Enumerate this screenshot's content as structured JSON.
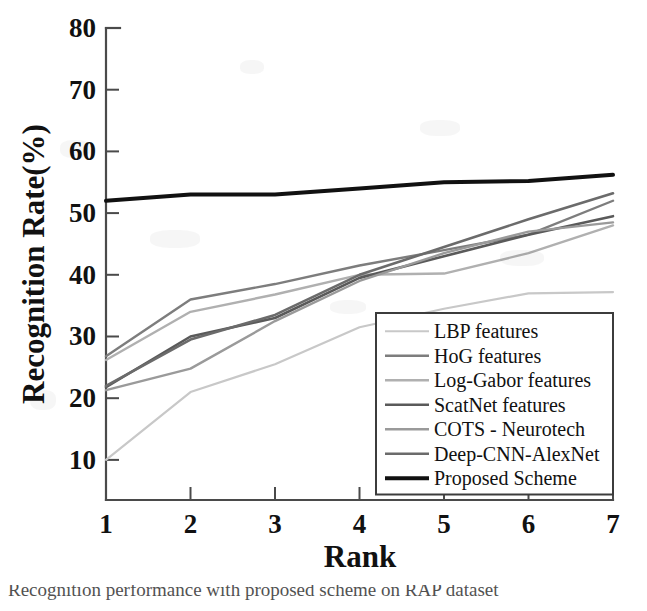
{
  "figure": {
    "caption_partial": "Recognition performance with proposed scheme on RAP dataset"
  },
  "chart_data": {
    "type": "line",
    "title": "",
    "xlabel": "Rank",
    "ylabel": "Recognition Rate(%)",
    "x": [
      1,
      2,
      3,
      4,
      5,
      6,
      7
    ],
    "categories": [
      "1",
      "2",
      "3",
      "4",
      "5",
      "6",
      "7"
    ],
    "xtick_labels": [
      "1",
      "2",
      "3",
      "4",
      "5",
      "6",
      "7"
    ],
    "ytick_labels": [
      "10",
      "20",
      "30",
      "40",
      "50",
      "60",
      "70",
      "80"
    ],
    "yticks": [
      10,
      20,
      30,
      40,
      50,
      60,
      70,
      80
    ],
    "xlim": [
      1,
      7
    ],
    "ylim": [
      3.5,
      80
    ],
    "grid": false,
    "legend_position": "lower right",
    "series": [
      {
        "name": "LBP features",
        "color": "#c8c8c8",
        "width": 2.2,
        "values": [
          10.0,
          21.0,
          25.5,
          31.5,
          34.5,
          37.0,
          37.2
        ]
      },
      {
        "name": "HoG features",
        "color": "#7d7d7d",
        "width": 2.4,
        "values": [
          26.8,
          36.0,
          38.5,
          41.5,
          44.0,
          46.5,
          52.0
        ]
      },
      {
        "name": "Log-Gabor features",
        "color": "#b0b0b0",
        "width": 2.4,
        "values": [
          26.2,
          34.0,
          36.8,
          40.0,
          40.2,
          43.5,
          48.0
        ]
      },
      {
        "name": "ScatNet features",
        "color": "#5a5a5a",
        "width": 2.6,
        "values": [
          21.8,
          30.0,
          33.0,
          39.5,
          43.0,
          46.5,
          49.5
        ]
      },
      {
        "name": "COTS - Neurotech",
        "color": "#9a9a9a",
        "width": 2.4,
        "values": [
          21.3,
          24.8,
          32.5,
          39.0,
          43.5,
          47.0,
          48.5
        ]
      },
      {
        "name": "Deep-CNN-AlexNet",
        "color": "#6b6b6b",
        "width": 2.6,
        "values": [
          22.0,
          29.5,
          33.5,
          40.0,
          44.5,
          49.0,
          53.2
        ]
      },
      {
        "name": "Proposed Scheme",
        "color": "#111111",
        "width": 4.0,
        "values": [
          52.0,
          53.0,
          53.0,
          54.0,
          55.0,
          55.2,
          56.2
        ]
      }
    ]
  },
  "axes_geometry": {
    "left_px": 106,
    "right_px": 613,
    "top_px": 28,
    "bottom_px": 500,
    "y_value_at_top": 80,
    "y_value_at_bottom": 3.5
  }
}
